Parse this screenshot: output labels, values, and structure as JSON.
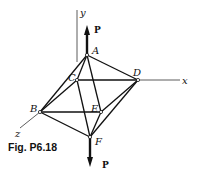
{
  "figure": {
    "caption": "Fig. P6.18",
    "axes": {
      "x": "x",
      "y": "y",
      "z": "z"
    },
    "nodes": [
      {
        "id": "A",
        "label": "A"
      },
      {
        "id": "B",
        "label": "B"
      },
      {
        "id": "C",
        "label": "C"
      },
      {
        "id": "D",
        "label": "D"
      },
      {
        "id": "E",
        "label": "E"
      },
      {
        "id": "F",
        "label": "F"
      }
    ],
    "loads": {
      "top": "P",
      "bottom": "P"
    }
  }
}
